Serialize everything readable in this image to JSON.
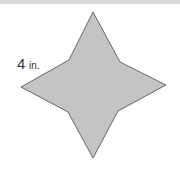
{
  "figure": {
    "shape": "four-pointed star",
    "fill": "#c4c4c4",
    "stroke": "#666666",
    "points": "93,12 120,62 166,85 118,111 93,158 68,112 21,87 69,60",
    "label": {
      "value": "4",
      "unit": "in."
    }
  }
}
